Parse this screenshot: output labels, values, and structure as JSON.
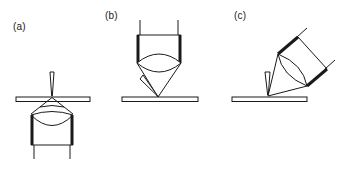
{
  "figure": {
    "panels": [
      {
        "id": "a",
        "label": "(a)",
        "configuration": "bottom illumination",
        "objective_position": "below sample",
        "tip_position": "above sample, vertical"
      },
      {
        "id": "b",
        "label": "(b)",
        "configuration": "top illumination",
        "objective_position": "above sample, vertical",
        "tip_position": "above sample, angled from left"
      },
      {
        "id": "c",
        "label": "(c)",
        "configuration": "side illumination",
        "objective_position": "above sample, tilted",
        "tip_position": "above sample, vertical"
      }
    ]
  },
  "colors": {
    "line": "#1a1a1a",
    "background": "#ffffff"
  }
}
